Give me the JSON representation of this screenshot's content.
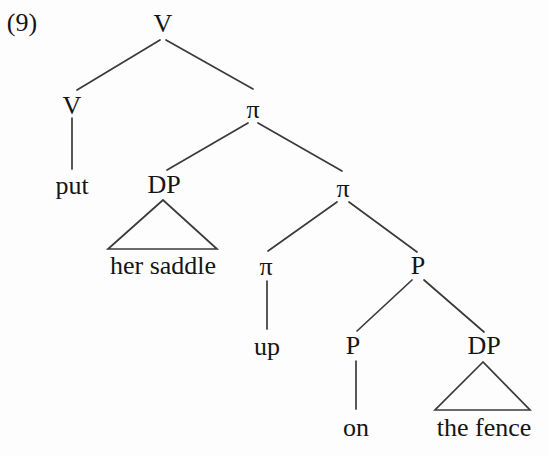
{
  "figure": {
    "example_number": "(9)"
  },
  "colors": {
    "background": "#fdfdfd",
    "line": "#3a3a3a",
    "text": "#151515"
  },
  "tree": {
    "nodes": [
      {
        "id": "v-root",
        "label": "V",
        "type": "nonterminal"
      },
      {
        "id": "v-head",
        "label": "V",
        "type": "nonterminal"
      },
      {
        "id": "pi-1",
        "label": "π",
        "type": "nonterminal"
      },
      {
        "id": "put",
        "label": "put",
        "type": "terminal"
      },
      {
        "id": "dp-1",
        "label": "DP",
        "type": "nonterminal"
      },
      {
        "id": "pi-2",
        "label": "π",
        "type": "nonterminal"
      },
      {
        "id": "her-saddle",
        "label": "her saddle",
        "type": "terminal"
      },
      {
        "id": "pi-3",
        "label": "π",
        "type": "nonterminal"
      },
      {
        "id": "p-1",
        "label": "P",
        "type": "nonterminal"
      },
      {
        "id": "up",
        "label": "up",
        "type": "terminal"
      },
      {
        "id": "p-2",
        "label": "P",
        "type": "nonterminal"
      },
      {
        "id": "dp-2",
        "label": "DP",
        "type": "nonterminal"
      },
      {
        "id": "on",
        "label": "on",
        "type": "terminal"
      },
      {
        "id": "the-fence",
        "label": "the fence",
        "type": "terminal"
      }
    ],
    "edges": [
      {
        "from": "v-root",
        "to": "v-head",
        "style": "line"
      },
      {
        "from": "v-root",
        "to": "pi-1",
        "style": "line"
      },
      {
        "from": "v-head",
        "to": "put",
        "style": "line"
      },
      {
        "from": "pi-1",
        "to": "dp-1",
        "style": "line"
      },
      {
        "from": "pi-1",
        "to": "pi-2",
        "style": "line"
      },
      {
        "from": "dp-1",
        "to": "her-saddle",
        "style": "triangle"
      },
      {
        "from": "pi-2",
        "to": "pi-3",
        "style": "line"
      },
      {
        "from": "pi-2",
        "to": "p-1",
        "style": "line"
      },
      {
        "from": "pi-3",
        "to": "up",
        "style": "line"
      },
      {
        "from": "p-1",
        "to": "p-2",
        "style": "line"
      },
      {
        "from": "p-1",
        "to": "dp-2",
        "style": "line"
      },
      {
        "from": "p-2",
        "to": "on",
        "style": "line"
      },
      {
        "from": "dp-2",
        "to": "the-fence",
        "style": "triangle"
      }
    ]
  }
}
